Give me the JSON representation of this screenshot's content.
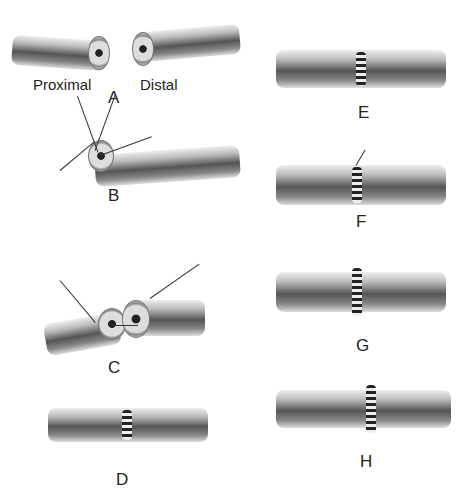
{
  "figure": {
    "panels": [
      {
        "id": "A",
        "label": "A",
        "sublabels": [
          "Proximal",
          "Distal"
        ]
      },
      {
        "id": "B",
        "label": "B"
      },
      {
        "id": "C",
        "label": "C"
      },
      {
        "id": "D",
        "label": "D"
      },
      {
        "id": "E",
        "label": "E"
      },
      {
        "id": "F",
        "label": "F"
      },
      {
        "id": "G",
        "label": "G"
      },
      {
        "id": "H",
        "label": "H"
      }
    ]
  }
}
